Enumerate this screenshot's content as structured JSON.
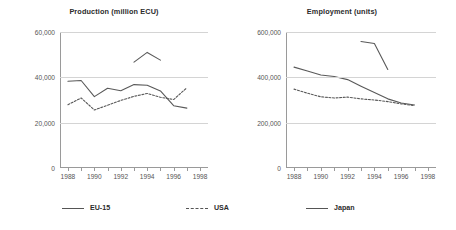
{
  "chart_data": [
    {
      "type": "line",
      "title": "Production (million ECU)",
      "xlabel": "",
      "ylabel": "",
      "xlim": [
        1987.4,
        1998.6
      ],
      "ylim": [
        0,
        60000
      ],
      "xticks": [
        1988,
        1990,
        1992,
        1994,
        1996,
        1998
      ],
      "xticklabels": [
        "1988",
        "1990",
        "1992",
        "1994",
        "1996",
        "1998"
      ],
      "yticks": [
        0,
        20000,
        40000,
        60000
      ],
      "yticklabels": [
        "0",
        "20,000",
        "40,000",
        "60,000"
      ],
      "grid": "horizontal",
      "legend_position": "bottom",
      "series": [
        {
          "name": "EU-15",
          "style": "solid",
          "color": "#595959",
          "x": [
            1988,
            1989,
            1990,
            1991,
            1992,
            1993,
            1994,
            1995,
            1996,
            1997
          ],
          "values": [
            38300,
            38600,
            31500,
            35200,
            34100,
            36800,
            36500,
            34000,
            27500,
            26400
          ]
        },
        {
          "name": "USA",
          "style": "dashed",
          "color": "#595959",
          "x": [
            1988,
            1989,
            1990,
            1991,
            1992,
            1993,
            1994,
            1995,
            1996,
            1997
          ],
          "values": [
            27900,
            30900,
            25600,
            27700,
            29800,
            31600,
            32900,
            31200,
            30200,
            35400
          ]
        },
        {
          "name": "Japan",
          "style": "solid",
          "color": "#595959",
          "x": [
            1993,
            1994,
            1995
          ],
          "values": [
            46700,
            51000,
            47600
          ]
        }
      ]
    },
    {
      "type": "line",
      "title": "Employment (units)",
      "xlabel": "",
      "ylabel": "",
      "xlim": [
        1987.4,
        1998.6
      ],
      "ylim": [
        0,
        600000
      ],
      "xticks": [
        1988,
        1990,
        1992,
        1994,
        1996,
        1998
      ],
      "xticklabels": [
        "1988",
        "1990",
        "1992",
        "1994",
        "1996",
        "1998"
      ],
      "yticks": [
        0,
        200000,
        400000,
        600000
      ],
      "yticklabels": [
        "0",
        "200,000",
        "400,000",
        "600,000"
      ],
      "grid": "horizontal",
      "legend_position": "bottom",
      "series": [
        {
          "name": "EU-15",
          "style": "solid",
          "color": "#595959",
          "x": [
            1988,
            1989,
            1990,
            1991,
            1992,
            1993,
            1994,
            1995,
            1996,
            1997
          ],
          "values": [
            445000,
            428000,
            410000,
            404000,
            390000,
            361000,
            333000,
            305000,
            287000,
            278000
          ]
        },
        {
          "name": "USA",
          "style": "dashed",
          "color": "#595959",
          "x": [
            1988,
            1989,
            1990,
            1991,
            1992,
            1993,
            1994,
            1995,
            1996,
            1997
          ],
          "values": [
            348000,
            330000,
            314000,
            309000,
            313000,
            305000,
            300000,
            293000,
            283000,
            275000
          ]
        },
        {
          "name": "Japan",
          "style": "solid",
          "color": "#595959",
          "x": [
            1993,
            1994,
            1995
          ],
          "values": [
            558000,
            549000,
            435000
          ]
        }
      ]
    }
  ],
  "legend": {
    "items": [
      {
        "label": "EU-15",
        "style": "solid"
      },
      {
        "label": "USA",
        "style": "dashed"
      },
      {
        "label": "Japan",
        "style": "solid"
      }
    ]
  }
}
